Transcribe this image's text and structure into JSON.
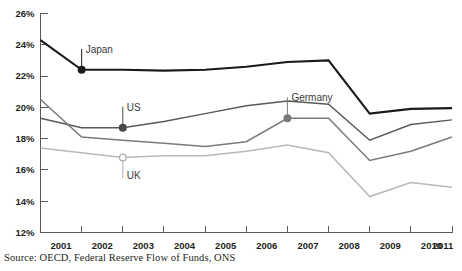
{
  "title_fragment": "",
  "source": {
    "text": "Source: OECD, Federal Reserve Flow of Funds, ONS"
  },
  "chart_data": {
    "type": "line",
    "title": "",
    "xlabel": "",
    "ylabel": "",
    "x": [
      2001,
      2002,
      2003,
      2004,
      2005,
      2006,
      2007,
      2008,
      2009,
      2010,
      2011
    ],
    "categories": [
      "2001",
      "2002",
      "2003",
      "2004",
      "2005",
      "2006",
      "2007",
      "2008",
      "2009",
      "2010",
      "2011"
    ],
    "ylim": [
      12,
      26
    ],
    "ytick_labels": [
      "12%",
      "14%",
      "16%",
      "18%",
      "20%",
      "22%",
      "24%",
      "26%"
    ],
    "ytick_values": [
      12,
      14,
      16,
      18,
      20,
      22,
      24,
      26
    ],
    "grid": false,
    "legend": "inline-callouts",
    "series": [
      {
        "name": "Japan",
        "color": "#1a1a1a",
        "width": 2.1,
        "values": [
          24.3,
          22.4,
          22.4,
          22.35,
          22.4,
          22.6,
          22.9,
          23.0,
          19.6,
          19.9,
          19.95
        ]
      },
      {
        "name": "US",
        "color": "#595959",
        "width": 1.5,
        "values": [
          19.3,
          18.7,
          18.7,
          19.1,
          19.6,
          20.1,
          20.4,
          20.2,
          17.9,
          18.9,
          19.2
        ]
      },
      {
        "name": "Germany",
        "color": "#7a7a7a",
        "width": 1.5,
        "values": [
          20.5,
          18.1,
          17.9,
          17.7,
          17.5,
          17.8,
          19.3,
          19.3,
          16.6,
          17.2,
          18.1
        ]
      },
      {
        "name": "UK",
        "color": "#b8b8b8",
        "width": 1.5,
        "values": [
          17.4,
          17.1,
          16.8,
          16.9,
          16.9,
          17.2,
          17.6,
          17.1,
          14.3,
          15.2,
          14.9
        ]
      }
    ],
    "annotations": [
      {
        "label": "Japan",
        "series": "Japan",
        "x": 2002,
        "y": 22.4,
        "marker": "filled",
        "marker_color": "#1a1a1a",
        "leader_direction": "up"
      },
      {
        "label": "US",
        "series": "US",
        "x": 2003,
        "y": 18.7,
        "marker": "filled",
        "marker_color": "#4a4a4a",
        "leader_direction": "up"
      },
      {
        "label": "Germany",
        "series": "Germany",
        "x": 2007,
        "y": 19.3,
        "marker": "filled",
        "marker_color": "#7a7a7a",
        "leader_direction": "up"
      },
      {
        "label": "UK",
        "series": "UK",
        "x": 2003,
        "y": 16.8,
        "marker": "hollow",
        "marker_color": "#b0b0b0",
        "leader_direction": "down"
      }
    ]
  }
}
